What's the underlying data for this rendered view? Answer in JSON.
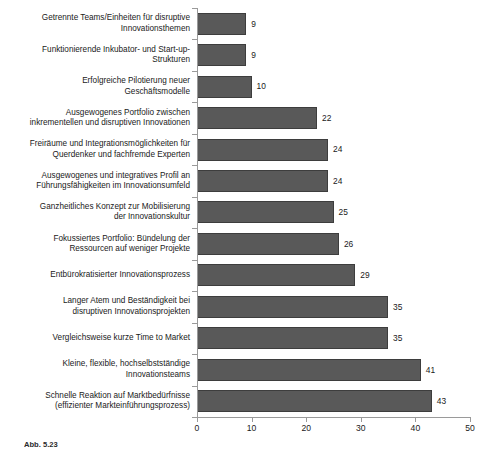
{
  "chart_data": {
    "type": "bar",
    "orientation": "horizontal",
    "title": "",
    "subtitle": "",
    "xlabel": "",
    "ylabel": "",
    "xlim": [
      0,
      50
    ],
    "xticks": [
      0,
      10,
      20,
      30,
      40,
      50
    ],
    "xtick_labels": [
      "0",
      "10",
      "20",
      "30",
      "40",
      "50"
    ],
    "grid": false,
    "legend": null,
    "bar_color": "#595959",
    "bar_edge_color": "#3d3d3d",
    "axis_color": "#9a9a9a",
    "text_color": "#1a1a1a",
    "categories": [
      "Getrennte Teams/Einheiten für disruptive\nInnovationsthemen",
      "Funktionierende Inkubator- und Start-up-\nStrukturen",
      "Erfolgreiche Pilotierung neuer\nGeschäftsmodelle",
      "Ausgewogenes Portfolio zwischen\ninkrementellen und disruptiven Innovationen",
      "Freiräume und Integrationsmöglichkeiten für\nQuerdenker und fachfremde Experten",
      "Ausgewogenes und integratives Profil an\nFührungsfähigkeiten im Innovationsumfeld",
      "Ganzheitliches Konzept zur Mobilisierung\nder Innovationskultur",
      "Fokussiertes Portfolio: Bündelung der\nRessourcen auf weniger Projekte",
      "Entbürokratisierter Innovationsprozess",
      "Langer Atem und Beständigkeit bei\ndisruptiven Innovationsprojekten",
      "Vergleichsweise kurze Time to Market",
      "Kleine, flexible, hochselbstständige\nInnovationsteams",
      "Schnelle Reaktion auf Marktbedürfnisse\n(effizienter Markteinführungsprozess)"
    ],
    "values": [
      9,
      9,
      10,
      22,
      24,
      24,
      25,
      26,
      29,
      35,
      35,
      41,
      43
    ],
    "value_labels": [
      "9",
      "9",
      "10",
      "22",
      "24",
      "24",
      "25",
      "26",
      "29",
      "35",
      "35",
      "41",
      "43"
    ]
  },
  "caption": {
    "label": "Abb. 5.23",
    "text": ""
  }
}
